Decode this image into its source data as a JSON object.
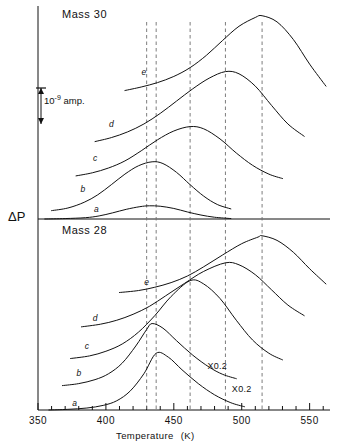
{
  "figure": {
    "panels": [
      {
        "id": "mass30",
        "title": "Mass 30"
      },
      {
        "id": "mass28",
        "title": "Mass 28"
      }
    ],
    "y_axis_label": "ΔP",
    "scale_bar": {
      "label": "10",
      "exponent": "-9",
      "unit": "amp.",
      "value_amp": 1e-09
    },
    "axis": {
      "xlabel_text": "Temperature",
      "xlabel_unit": "(K)",
      "xmin": 350,
      "xmax": 565,
      "major_ticks": [
        350,
        400,
        450,
        500,
        550
      ],
      "major_tick_labels": [
        "350",
        "400",
        "450",
        "500",
        "550"
      ],
      "minor_tick_step": 10
    },
    "guide_lines_K": [
      430,
      437,
      462,
      488,
      515
    ],
    "annotations": [
      {
        "text": "X0.2",
        "panel": "mass28",
        "x_K": 482,
        "curve": "d"
      },
      {
        "text": "X0.2",
        "panel": "mass28",
        "x_K": 497,
        "curve": "e"
      }
    ]
  },
  "chart_data": {
    "type": "line",
    "xlabel": "Temperature (K)",
    "ylabel": "ΔP",
    "xlim": [
      350,
      565
    ],
    "grid": false,
    "legend": "inline curve labels a–e",
    "panels": [
      {
        "name": "Mass 30",
        "series": [
          {
            "name": "a",
            "peak_K": 432,
            "peak_height": 0.3,
            "width": 38,
            "baseline": 0.0,
            "label_x_K": 393,
            "label_y": 0.16,
            "x": [
              355,
              370,
              385,
              395,
              405,
              415,
              425,
              432,
              440,
              450,
              460,
              470,
              480,
              492
            ],
            "y": [
              0.0,
              0.01,
              0.03,
              0.07,
              0.14,
              0.22,
              0.28,
              0.3,
              0.29,
              0.24,
              0.16,
              0.09,
              0.04,
              0.01
            ]
          },
          {
            "name": "b",
            "peak_K": 434,
            "peak_height": 1.3,
            "width": 36,
            "baseline": 0.18,
            "label_x_K": 383,
            "label_y": 0.62,
            "x": [
              360,
              372,
              384,
              394,
              404,
              414,
              424,
              434,
              442,
              452,
              462,
              472,
              482,
              492
            ],
            "y": [
              0.19,
              0.25,
              0.38,
              0.55,
              0.78,
              1.02,
              1.21,
              1.3,
              1.26,
              1.06,
              0.78,
              0.52,
              0.33,
              0.23
            ]
          },
          {
            "name": "c",
            "peak_K": 462,
            "peak_height": 2.1,
            "width": 40,
            "baseline": 0.95,
            "label_x_K": 392,
            "label_y": 1.32,
            "x": [
              378,
              390,
              402,
              414,
              426,
              438,
              450,
              462,
              472,
              484,
              496,
              508,
              520,
              530
            ],
            "y": [
              0.98,
              1.05,
              1.16,
              1.32,
              1.55,
              1.8,
              2.0,
              2.1,
              2.05,
              1.82,
              1.5,
              1.22,
              1.02,
              0.92
            ]
          },
          {
            "name": "d",
            "peak_K": 488,
            "peak_height": 3.35,
            "width": 44,
            "baseline": 1.72,
            "label_x_K": 404,
            "label_y": 2.1,
            "x": [
              392,
              404,
              416,
              428,
              440,
              452,
              464,
              476,
              488,
              498,
              510,
              522,
              534,
              546
            ],
            "y": [
              1.76,
              1.85,
              1.98,
              2.16,
              2.4,
              2.68,
              2.96,
              3.2,
              3.35,
              3.3,
              3.02,
              2.58,
              2.16,
              1.88
            ]
          },
          {
            "name": "e",
            "peak_K": 515,
            "peak_height": 4.62,
            "width": 46,
            "baseline": 2.85,
            "label_x_K": 428,
            "label_y": 3.28,
            "x": [
              414,
              426,
              438,
              450,
              462,
              474,
              486,
              498,
              510,
              515,
              526,
              538,
              550,
              562
            ],
            "y": [
              2.92,
              3.0,
              3.1,
              3.24,
              3.44,
              3.72,
              4.06,
              4.38,
              4.58,
              4.62,
              4.48,
              4.08,
              3.52,
              3.02
            ]
          }
        ]
      },
      {
        "name": "Mass 28",
        "series": [
          {
            "name": "a",
            "peak_K": 437,
            "peak_height": 1.72,
            "width": 34,
            "baseline": 0.0,
            "label_x_K": 377,
            "label_y": 0.12,
            "x": [
              358,
              372,
              386,
              398,
              408,
              418,
              428,
              437,
              446,
              456,
              468,
              480,
              492,
              502
            ],
            "y": [
              0.0,
              0.02,
              0.06,
              0.14,
              0.28,
              0.58,
              1.1,
              1.72,
              1.6,
              1.22,
              0.8,
              0.46,
              0.22,
              0.1
            ]
          },
          {
            "name": "b",
            "peak_K": 434,
            "peak_height": 2.62,
            "width": 32,
            "baseline": 0.72,
            "label_x_K": 380,
            "label_y": 1.02,
            "x": [
              368,
              380,
              392,
              402,
              412,
              422,
              430,
              434,
              442,
              452,
              464,
              476,
              486,
              496
            ],
            "y": [
              0.74,
              0.8,
              0.92,
              1.1,
              1.42,
              1.94,
              2.44,
              2.62,
              2.48,
              2.1,
              1.66,
              1.3,
              1.08,
              0.95
            ]
          },
          {
            "name": "c",
            "peak_K": 462,
            "peak_height": 3.92,
            "width": 36,
            "baseline": 1.52,
            "label_x_K": 386,
            "label_y": 1.86,
            "x": [
              374,
              388,
              400,
              412,
              424,
              436,
              448,
              462,
              472,
              484,
              496,
              508,
              520,
              530
            ],
            "y": [
              1.56,
              1.64,
              1.78,
              2.0,
              2.36,
              2.86,
              3.44,
              3.92,
              3.82,
              3.38,
              2.72,
              2.12,
              1.72,
              1.52
            ]
          },
          {
            "name": "d",
            "peak_K": 488,
            "peak_height": 4.46,
            "width": 40,
            "baseline": 2.48,
            "label_x_K": 392,
            "label_y": 2.7,
            "x": [
              382,
              396,
              408,
              420,
              432,
              444,
              458,
              472,
              488,
              498,
              510,
              522,
              534,
              546
            ],
            "y": [
              2.52,
              2.6,
              2.72,
              2.9,
              3.14,
              3.46,
              3.84,
              4.2,
              4.46,
              4.4,
              4.1,
              3.64,
              3.18,
              2.86
            ]
          },
          {
            "name": "e",
            "peak_K": 515,
            "peak_height": 5.28,
            "width": 42,
            "baseline": 3.52,
            "label_x_K": 430,
            "label_y": 3.8,
            "x": [
              410,
              424,
              436,
              448,
              460,
              472,
              486,
              500,
              512,
              515,
              526,
              538,
              550,
              562
            ],
            "y": [
              3.56,
              3.62,
              3.72,
              3.86,
              4.06,
              4.34,
              4.7,
              5.04,
              5.24,
              5.28,
              5.14,
              4.78,
              4.28,
              3.82
            ]
          }
        ]
      }
    ]
  }
}
